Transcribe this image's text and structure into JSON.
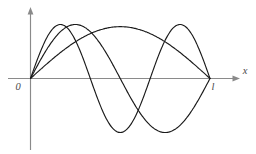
{
  "figure": {
    "background_color": "#ffffff",
    "curve_color": "#1a1a1a",
    "axis_color": "#8a8a8a",
    "label_color": "#4a4a4a"
  },
  "labels": {
    "origin": "0",
    "length": "l",
    "x_axis": "x"
  },
  "chart_data": {
    "type": "line",
    "title": "",
    "xlabel": "x",
    "ylabel": "",
    "xlim": [
      0,
      1
    ],
    "ylim": [
      -1.15,
      1.15
    ],
    "grid": false,
    "legend": "none",
    "xticks": [
      0,
      1
    ],
    "xticklabels": [
      "0",
      "l"
    ],
    "yticks": [],
    "yticklabels": [],
    "annotations": [
      {
        "text": "0",
        "x": 0,
        "y": 0,
        "placement": "below-left"
      },
      {
        "text": "l",
        "x": 1,
        "y": 0,
        "placement": "below"
      },
      {
        "text": "x",
        "x": 1.18,
        "y": 0,
        "placement": "right"
      }
    ],
    "domain": {
      "start": 0,
      "end": 1,
      "label_start": "0",
      "label_end": "l"
    },
    "series": [
      {
        "name": "n = 1",
        "harmonic": 1,
        "function": "sin(1*pi*x/l)",
        "amplitude": 0.96,
        "nodes": [
          0,
          1
        ],
        "antinodes": [
          {
            "x": 0.5,
            "y": 0.96
          }
        ],
        "x": [
          0,
          0.05,
          0.1,
          0.15,
          0.2,
          0.25,
          0.3,
          0.35,
          0.4,
          0.45,
          0.5,
          0.55,
          0.6,
          0.65,
          0.7,
          0.75,
          0.8,
          0.85,
          0.9,
          0.95,
          1
        ],
        "values": [
          0,
          0.15,
          0.3,
          0.44,
          0.56,
          0.68,
          0.78,
          0.86,
          0.91,
          0.95,
          0.96,
          0.95,
          0.91,
          0.86,
          0.78,
          0.68,
          0.56,
          0.44,
          0.3,
          0.15,
          0
        ]
      },
      {
        "name": "n = 2",
        "harmonic": 2,
        "function": "sin(2*pi*x/l)",
        "amplitude": 1.0,
        "nodes": [
          0,
          0.5,
          1
        ],
        "antinodes": [
          {
            "x": 0.25,
            "y": 1.0
          },
          {
            "x": 0.75,
            "y": -1.0
          }
        ],
        "x": [
          0,
          0.05,
          0.1,
          0.15,
          0.2,
          0.25,
          0.3,
          0.35,
          0.4,
          0.45,
          0.5,
          0.55,
          0.6,
          0.65,
          0.7,
          0.75,
          0.8,
          0.85,
          0.9,
          0.95,
          1
        ],
        "values": [
          0,
          0.31,
          0.59,
          0.81,
          0.95,
          1.0,
          0.95,
          0.81,
          0.59,
          0.31,
          0,
          -0.31,
          -0.59,
          -0.81,
          -0.95,
          -1.0,
          -0.95,
          -0.81,
          -0.59,
          -0.31,
          0
        ]
      },
      {
        "name": "n = 3",
        "harmonic": 3,
        "function": "sin(3*pi*x/l)",
        "amplitude": 1.0,
        "nodes": [
          0,
          0.3333,
          0.6667,
          1
        ],
        "antinodes": [
          {
            "x": 0.1667,
            "y": 1.0
          },
          {
            "x": 0.5,
            "y": -1.0
          },
          {
            "x": 0.8333,
            "y": 1.0
          }
        ],
        "x": [
          0,
          0.05,
          0.1,
          0.15,
          0.2,
          0.25,
          0.3,
          0.35,
          0.4,
          0.45,
          0.5,
          0.55,
          0.6,
          0.65,
          0.7,
          0.75,
          0.8,
          0.85,
          0.9,
          0.95,
          1
        ],
        "values": [
          0,
          0.45,
          0.81,
          0.99,
          0.95,
          0.71,
          0.31,
          -0.16,
          -0.59,
          -0.89,
          -1.0,
          -0.89,
          -0.59,
          -0.16,
          0.31,
          0.71,
          0.95,
          0.99,
          0.81,
          0.45,
          0
        ]
      }
    ]
  }
}
